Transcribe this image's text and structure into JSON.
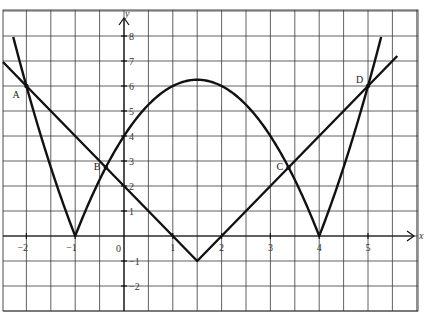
{
  "chart_data": {
    "type": "line",
    "title": "",
    "xlabel": "x",
    "ylabel": "y",
    "xlim": [
      -2.5,
      6.0
    ],
    "ylim": [
      -3,
      9
    ],
    "grid": true,
    "grid_spacing": {
      "x": 0.5,
      "y": 1
    },
    "x_ticks": [
      -2,
      -1,
      0,
      1,
      2,
      3,
      4,
      5
    ],
    "x_tick_labels": [
      "−2",
      "−1",
      "0",
      "1",
      "2",
      "3",
      "4",
      "5"
    ],
    "y_ticks": [
      8,
      7,
      6,
      5,
      4,
      3,
      2,
      1,
      -1,
      -2
    ],
    "y_tick_labels": [
      "8",
      "7",
      "6",
      "5",
      "4",
      "3",
      "2",
      "1",
      "−1",
      "−2"
    ],
    "series": [
      {
        "name": "y = |(x+1)(x−4)|",
        "kind": "curve",
        "x_range": [
          -2.27,
          5.27
        ],
        "key_points": [
          {
            "x": -2.27,
            "y": 8.0
          },
          {
            "x": -2,
            "y": 6
          },
          {
            "x": -1,
            "y": 0
          },
          {
            "x": 0,
            "y": 4
          },
          {
            "x": 1.5,
            "y": 6.25
          },
          {
            "x": 3,
            "y": 4
          },
          {
            "x": 4,
            "y": 0
          },
          {
            "x": 5,
            "y": 6
          },
          {
            "x": 5.27,
            "y": 8.1
          }
        ]
      },
      {
        "name": "y = 2|x − 1.5| − 1",
        "kind": "polyline",
        "points": [
          {
            "x": -2.48,
            "y": 6.96
          },
          {
            "x": 1.5,
            "y": -1
          },
          {
            "x": 5.6,
            "y": 7.2
          }
        ]
      }
    ],
    "annotations": [
      {
        "label": "A",
        "x": -2,
        "y": 6
      },
      {
        "label": "B",
        "x": -0.372,
        "y": 2.74
      },
      {
        "label": "C",
        "x": 3.372,
        "y": 2.74
      },
      {
        "label": "D",
        "x": 5,
        "y": 6
      }
    ]
  },
  "labels": {
    "top_text": "",
    "x_axis": "x",
    "y_axis": "y",
    "origin": "0",
    "point_a": "A",
    "point_b": "B",
    "point_c": "C",
    "point_d": "D"
  }
}
